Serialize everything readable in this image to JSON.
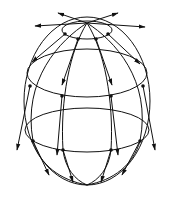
{
  "diagram": {
    "colors": {
      "line": "#111111",
      "background": "#ffffff"
    },
    "sphere": {
      "cx": 87,
      "cy": 101,
      "rx": 63,
      "ry": 84
    },
    "latitudes": [
      {
        "name": "polar-cap",
        "cx": 87,
        "cy": 30,
        "rx": 25,
        "ry": 9
      },
      {
        "name": "upper",
        "cx": 87,
        "cy": 73,
        "rx": 60,
        "ry": 24
      },
      {
        "name": "lower",
        "cx": 87,
        "cy": 130,
        "rx": 62,
        "ry": 22
      }
    ],
    "points": [
      [
        65,
        34
      ],
      [
        78,
        39
      ],
      [
        96,
        39
      ],
      [
        108,
        34
      ],
      [
        30,
        86
      ],
      [
        62,
        96
      ],
      [
        111,
        96
      ],
      [
        143,
        86
      ],
      [
        33,
        141
      ],
      [
        63,
        150
      ],
      [
        111,
        150
      ],
      [
        140,
        141
      ]
    ],
    "arrows": [
      {
        "from": [
          87,
          23
        ],
        "to": [
          58,
          13
        ]
      },
      {
        "from": [
          87,
          23
        ],
        "to": [
          118,
          13
        ]
      },
      {
        "from": [
          87,
          23
        ],
        "to": [
          35,
          26
        ]
      },
      {
        "from": [
          87,
          23
        ],
        "to": [
          145,
          27
        ]
      },
      {
        "from": [
          65,
          34
        ],
        "to": [
          32,
          62
        ]
      },
      {
        "from": [
          108,
          34
        ],
        "to": [
          140,
          64
        ]
      },
      {
        "from": [
          78,
          39
        ],
        "to": [
          62,
          85
        ]
      },
      {
        "from": [
          96,
          39
        ],
        "to": [
          112,
          85
        ]
      },
      {
        "from": [
          30,
          86
        ],
        "to": [
          17,
          150
        ]
      },
      {
        "from": [
          143,
          86
        ],
        "to": [
          155,
          150
        ]
      },
      {
        "from": [
          62,
          96
        ],
        "to": [
          57,
          155
        ]
      },
      {
        "from": [
          111,
          96
        ],
        "to": [
          118,
          155
        ]
      },
      {
        "from": [
          33,
          141
        ],
        "to": [
          49,
          175
        ]
      },
      {
        "from": [
          140,
          141
        ],
        "to": [
          122,
          175
        ]
      },
      {
        "from": [
          63,
          150
        ],
        "to": [
          73,
          182
        ]
      },
      {
        "from": [
          111,
          150
        ],
        "to": [
          101,
          182
        ]
      }
    ]
  }
}
